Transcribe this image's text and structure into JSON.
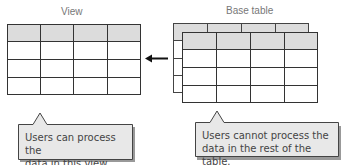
{
  "view": {
    "title": "View",
    "columns": 4,
    "rows": 4,
    "header_fill": "#dcdcdc"
  },
  "base_table": {
    "title": "Base table",
    "columns": 4,
    "rows": 4,
    "layers": 2,
    "header_fill": "#dcdcdc"
  },
  "arrow": {
    "direction": "left",
    "from": "base_table",
    "to": "view"
  },
  "callouts": [
    {
      "line1": "Users can process the",
      "line2": "data in this view."
    },
    {
      "line1": "Users cannot process the",
      "line2": "data in the rest of the table."
    }
  ],
  "colors": {
    "grid_line": "#333333",
    "header_fill": "#dcdcdc",
    "callout_fill": "#e8e8e8",
    "callout_border": "#444444",
    "label_text": "#777777"
  }
}
